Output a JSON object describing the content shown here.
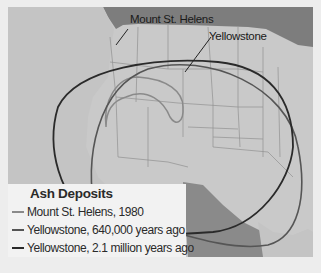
{
  "map": {
    "labels": {
      "mount_st_helens": "Mount St. Helens",
      "yellowstone": "Yellowstone"
    },
    "colors": {
      "land": "#c9c9c9",
      "ocean_canada": "#7d7d7d",
      "borders": "#8f8f8f",
      "mexico_gulf": "#8a8a8a"
    }
  },
  "legend": {
    "title": "Ash Deposits",
    "items": [
      {
        "label": "Mount St. Helens, 1980",
        "color": "#8a8a8a"
      },
      {
        "label": "Yellowstone, 640,000 years ago",
        "color": "#555555"
      },
      {
        "label": "Yellowstone, 2.1 million years ago",
        "color": "#2a2a2a"
      }
    ]
  }
}
